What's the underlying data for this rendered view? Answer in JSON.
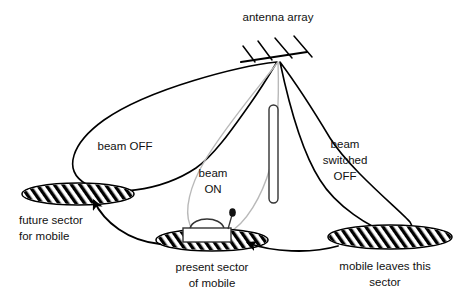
{
  "figure": {
    "background_color": "#ffffff",
    "line_color": "#000000",
    "beam_on_color": "#b9b9b9"
  },
  "labels": {
    "antenna_array": "antenna array",
    "beam_off_left": "beam OFF",
    "beam_on_line1": "beam",
    "beam_on_line2": "ON",
    "beam_switched_off_line1": "beam",
    "beam_switched_off_line2": "switched",
    "beam_switched_off_line3": "OFF",
    "future_sector_line1": "future sector",
    "future_sector_line2": "for mobile",
    "present_sector_line1": "present sector",
    "present_sector_line2": "of mobile",
    "mobile_leaves_line1": "mobile leaves this",
    "mobile_leaves_line2": "sector"
  },
  "elements": {
    "antenna_array_name": "antenna-array",
    "antenna_element_count": 4,
    "left_beam_state": "OFF",
    "center_beam_state": "ON",
    "right_beam_state": "switched OFF",
    "sectors": [
      {
        "id": "future-sector",
        "label": "future sector for mobile",
        "fill": "hatched"
      },
      {
        "id": "present-sector",
        "label": "present sector of mobile",
        "fill": "hatched"
      },
      {
        "id": "left-sector",
        "label": "mobile leaves this sector",
        "fill": "hatched"
      }
    ],
    "mobile_name": "mobile-vehicle",
    "tower_name": "tower"
  }
}
